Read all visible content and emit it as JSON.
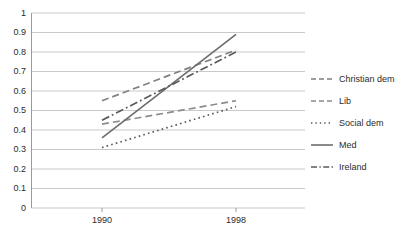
{
  "chart_data": {
    "type": "line",
    "title": "",
    "xlabel": "",
    "ylabel": "",
    "categories": [
      "1990",
      "1998"
    ],
    "x": [
      1990,
      1998
    ],
    "ylim": [
      0,
      1
    ],
    "ytick_step": 0.1,
    "yticks": [
      "1",
      "0.9",
      "0.8",
      "0.7",
      "0.6",
      "0.5",
      "0.4",
      "0.3",
      "0.2",
      "0.1",
      "0"
    ],
    "ytick_values": [
      1,
      0.9,
      0.8,
      0.7,
      0.6,
      0.5,
      0.4,
      0.3,
      0.2,
      0.1,
      0
    ],
    "grid": "horizontal",
    "legend_position": "right",
    "series": [
      {
        "name": "Christian dem",
        "values": [
          0.55,
          0.81
        ],
        "style": "dashed",
        "color": "#808080"
      },
      {
        "name": "Lib",
        "values": [
          0.43,
          0.55
        ],
        "style": "dashed",
        "color": "#8c8c8c"
      },
      {
        "name": "Social dem",
        "values": [
          0.31,
          0.52
        ],
        "style": "dotted",
        "color": "#5a5a5a"
      },
      {
        "name": "Med",
        "values": [
          0.36,
          0.89
        ],
        "style": "solid",
        "color": "#6e6e6e"
      },
      {
        "name": "Ireland",
        "values": [
          0.45,
          0.8
        ],
        "style": "dashdot",
        "color": "#5a5a5a"
      }
    ]
  },
  "axes": {
    "grid_color": "#c9c9c9",
    "axis_color": "#9a9a9a",
    "tick_text_color": "#2b2b2b"
  }
}
